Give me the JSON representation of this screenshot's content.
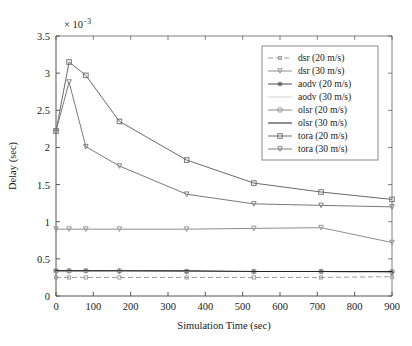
{
  "chart_data": {
    "type": "line",
    "title": "",
    "xlabel": "Simulation Time (sec)",
    "ylabel": "Delay (sec)",
    "y_multiplier": "× 10",
    "y_multiplier_exponent": "−3",
    "y_multiplier_full": "× 10⁻³",
    "xlim": [
      0,
      900
    ],
    "ylim": [
      0,
      3.5
    ],
    "xticks": [
      0,
      100,
      200,
      300,
      400,
      500,
      600,
      700,
      800,
      900
    ],
    "yticks": [
      0,
      0.5,
      1,
      1.5,
      2,
      2.5,
      3,
      3.5
    ],
    "xticklabels": [
      "0",
      "100",
      "200",
      "300",
      "400",
      "500",
      "600",
      "700",
      "800",
      "900"
    ],
    "yticklabels": [
      "0",
      "0.5",
      "1",
      "1.5",
      "2",
      "2.5",
      "3",
      "3.5"
    ],
    "grid": false,
    "legend_position": "upper right",
    "x": [
      0,
      35,
      80,
      170,
      350,
      530,
      710,
      900
    ],
    "series": [
      {
        "name": "dsr (20 m/s)",
        "label": "dsr (20 m/s)",
        "marker": "square-small",
        "linestyle": "dashed",
        "color": "#9a9a9a",
        "values": [
          0.25,
          0.25,
          0.25,
          0.25,
          0.25,
          0.25,
          0.25,
          0.26
        ]
      },
      {
        "name": "dsr (30 m/s)",
        "label": "dsr (30 m/s)",
        "marker": "triangle-down",
        "linestyle": "solid",
        "color": "#8e8e8e",
        "values": [
          0.9,
          0.9,
          0.9,
          0.9,
          0.9,
          0.91,
          0.92,
          0.72
        ]
      },
      {
        "name": "aodv (20 m/s)",
        "label": "aodv (20 m/s)",
        "marker": "asterisk",
        "linestyle": "solid",
        "color": "#4a4a4a",
        "values": [
          0.34,
          0.34,
          0.34,
          0.33,
          0.33,
          0.33,
          0.33,
          0.32
        ]
      },
      {
        "name": "aodv (30 m/s)",
        "label": "aodv (30 m/s)",
        "marker": "none",
        "linestyle": "solid",
        "color": "#d2d2d2",
        "values": [
          0.33,
          0.33,
          0.33,
          0.33,
          0.33,
          0.33,
          0.33,
          0.31
        ]
      },
      {
        "name": "olsr (20 m/s)",
        "label": "olsr (20 m/s)",
        "marker": "circle",
        "linestyle": "solid",
        "color": "#8a8a8a",
        "values": [
          0.34,
          0.34,
          0.34,
          0.34,
          0.33,
          0.33,
          0.33,
          0.33
        ]
      },
      {
        "name": "olsr (30 m/s)",
        "label": "olsr (30 m/s)",
        "marker": "none",
        "linestyle": "solid",
        "color": "#222222",
        "values": [
          0.34,
          0.34,
          0.34,
          0.34,
          0.34,
          0.33,
          0.33,
          0.33
        ]
      },
      {
        "name": "tora (20 m/s)",
        "label": "tora (20 m/s)",
        "marker": "square",
        "linestyle": "solid",
        "color": "#6a6a6a",
        "values": [
          2.22,
          3.15,
          2.97,
          2.35,
          1.83,
          1.52,
          1.4,
          1.3
        ]
      },
      {
        "name": "tora (30 m/s)",
        "label": "tora (30 m/s)",
        "marker": "triangle-down",
        "linestyle": "solid",
        "color": "#7a7a7a",
        "values": [
          2.22,
          2.88,
          2.01,
          1.75,
          1.37,
          1.24,
          1.22,
          1.2
        ]
      }
    ]
  }
}
